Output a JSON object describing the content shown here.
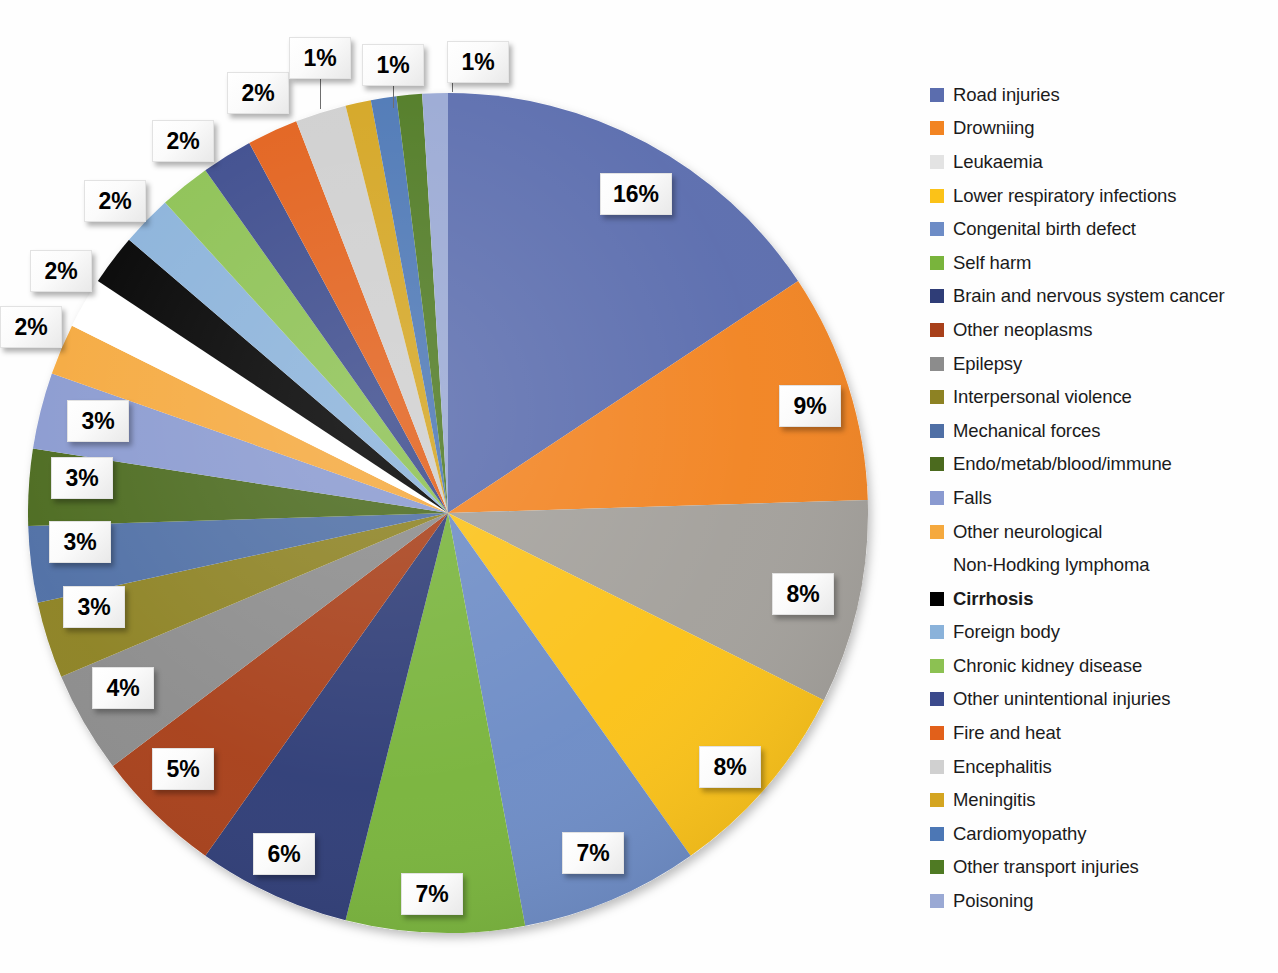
{
  "chart_data": {
    "type": "pie",
    "title": "",
    "subtitle": "",
    "xlabel": "",
    "ylabel": "",
    "grid": false,
    "legend_position": "right",
    "units": "percent",
    "start_angle_deg": 0,
    "direction": "clockwise",
    "total": 100,
    "categories": [
      "Road injuries",
      "Drowniing",
      "Leukaemia",
      "Lower respiratory infections",
      "Congenital birth defect",
      "Self harm",
      "Brain and nervous system cancer",
      "Other neoplasms",
      "Epilepsy",
      "Interpersonal violence",
      "Mechanical forces",
      "Endo/metab/blood/immune",
      "Falls",
      "Other neurological",
      "Non-Hodking lymphoma",
      "Cirrhosis",
      "Foreign body",
      "Chronic kidney disease",
      "Other unintentional injuries",
      "Fire and heat",
      "Encephalitis",
      "Meningitis",
      "Cardiomyopathy",
      "Other transport injuries",
      "Poisoning"
    ],
    "values": [
      16,
      9,
      8,
      8,
      7,
      7,
      6,
      5,
      4,
      3,
      3,
      3,
      3,
      2,
      2,
      2,
      2,
      2,
      2,
      2,
      2,
      1,
      1,
      1,
      1
    ],
    "colors": [
      "#5b6dae",
      "#f28422",
      "#a3a09b",
      "#fbc218",
      "#6d8cc6",
      "#79b43c",
      "#2f3d77",
      "#a8401a",
      "#8c8c8c",
      "#8d8223",
      "#4f6fa5",
      "#4b6a1e",
      "#8a9ad0",
      "#f5a košs",
      "#ffffff",
      "#000000",
      "#8ab2da",
      "#8cc152",
      "#3b4a8c",
      "#e2601a",
      "#cfcfcf",
      "#d4a521",
      "#4c77b5",
      "#4f7a23",
      "#9aa9d4"
    ],
    "slice_labels": [
      "16%",
      "9%",
      "8%",
      "8%",
      "7%",
      "7%",
      "6%",
      "5%",
      "4%",
      "3%",
      "3%",
      "3%",
      "3%",
      "2%",
      "2%",
      "2%",
      "2%",
      "2%",
      "2%",
      "2%",
      "2%",
      "1%",
      "1%",
      "1%",
      "1%"
    ]
  },
  "legend": {
    "items": [
      {
        "label": "Road injuries",
        "color": "#5b6dae",
        "emphasis": false
      },
      {
        "label": "Drowniing",
        "color": "#f28422",
        "emphasis": false
      },
      {
        "label": "Leukaemia",
        "color": "#e3e3e3",
        "emphasis": false
      },
      {
        "label": "Lower respiratory infections",
        "color": "#fbc218",
        "emphasis": false
      },
      {
        "label": "Congenital birth defect",
        "color": "#6d8cc6",
        "emphasis": false
      },
      {
        "label": "Self harm",
        "color": "#79b43c",
        "emphasis": false
      },
      {
        "label": "Brain and nervous system cancer",
        "color": "#2f3d77",
        "emphasis": false
      },
      {
        "label": "Other neoplasms",
        "color": "#a8401a",
        "emphasis": false
      },
      {
        "label": "Epilepsy",
        "color": "#8c8c8c",
        "emphasis": false
      },
      {
        "label": "Interpersonal violence",
        "color": "#8d8223",
        "emphasis": false
      },
      {
        "label": "Mechanical forces",
        "color": "#4f6fa5",
        "emphasis": false
      },
      {
        "label": "Endo/metab/blood/immune",
        "color": "#4b6a1e",
        "emphasis": false
      },
      {
        "label": "Falls",
        "color": "#8a9ad0",
        "emphasis": false
      },
      {
        "label": "Other neurological",
        "color": "#f5a93e",
        "emphasis": false
      },
      {
        "label": "Non-Hodking lymphoma",
        "color": "transparent",
        "emphasis": false
      },
      {
        "label": "Cirrhosis",
        "color": "#000000",
        "emphasis": true
      },
      {
        "label": "Foreign body",
        "color": "#8ab2da",
        "emphasis": false
      },
      {
        "label": "Chronic kidney disease",
        "color": "#8cc152",
        "emphasis": false
      },
      {
        "label": "Other unintentional injuries",
        "color": "#3b4a8c",
        "emphasis": false
      },
      {
        "label": "Fire and heat",
        "color": "#e2601a",
        "emphasis": false
      },
      {
        "label": "Encephalitis",
        "color": "#d0d0d0",
        "emphasis": false
      },
      {
        "label": "Meningitis",
        "color": "#d4a521",
        "emphasis": false
      },
      {
        "label": "Cardiomyopathy",
        "color": "#4c77b5",
        "emphasis": false
      },
      {
        "label": "Other transport injuries",
        "color": "#4f7a23",
        "emphasis": false
      },
      {
        "label": "Poisoning",
        "color": "#9aa9d4",
        "emphasis": false
      }
    ]
  },
  "pie_geometry": {
    "cx": 448,
    "cy": 513,
    "r": 420
  },
  "callouts": [
    {
      "text": "16%",
      "x": 600,
      "y": 173,
      "w": 72,
      "h": 42,
      "fs": 23
    },
    {
      "text": "9%",
      "x": 779,
      "y": 385,
      "w": 62,
      "h": 42,
      "fs": 23
    },
    {
      "text": "8%",
      "x": 772,
      "y": 573,
      "w": 62,
      "h": 42,
      "fs": 23
    },
    {
      "text": "8%",
      "x": 699,
      "y": 746,
      "w": 62,
      "h": 42,
      "fs": 23
    },
    {
      "text": "7%",
      "x": 562,
      "y": 832,
      "w": 62,
      "h": 42,
      "fs": 23
    },
    {
      "text": "7%",
      "x": 401,
      "y": 873,
      "w": 62,
      "h": 42,
      "fs": 23
    },
    {
      "text": "6%",
      "x": 253,
      "y": 833,
      "w": 62,
      "h": 42,
      "fs": 23
    },
    {
      "text": "5%",
      "x": 152,
      "y": 748,
      "w": 62,
      "h": 42,
      "fs": 23
    },
    {
      "text": "4%",
      "x": 92,
      "y": 667,
      "w": 62,
      "h": 42,
      "fs": 23
    },
    {
      "text": "3%",
      "x": 63,
      "y": 586,
      "w": 62,
      "h": 42,
      "fs": 23
    },
    {
      "text": "3%",
      "x": 49,
      "y": 521,
      "w": 62,
      "h": 42,
      "fs": 23
    },
    {
      "text": "3%",
      "x": 51,
      "y": 457,
      "w": 62,
      "h": 42,
      "fs": 23
    },
    {
      "text": "3%",
      "x": 67,
      "y": 400,
      "w": 62,
      "h": 42,
      "fs": 23
    },
    {
      "text": "2%",
      "x": 0,
      "y": 306,
      "w": 62,
      "h": 42,
      "fs": 23
    },
    {
      "text": "2%",
      "x": 30,
      "y": 250,
      "w": 62,
      "h": 42,
      "fs": 23
    },
    {
      "text": "2%",
      "x": 84,
      "y": 180,
      "w": 62,
      "h": 42,
      "fs": 23
    },
    {
      "text": "2%",
      "x": 152,
      "y": 120,
      "w": 62,
      "h": 42,
      "fs": 23
    },
    {
      "text": "2%",
      "x": 227,
      "y": 72,
      "w": 62,
      "h": 42,
      "fs": 23
    },
    {
      "text": "1%",
      "x": 289,
      "y": 37,
      "w": 62,
      "h": 42,
      "fs": 23
    },
    {
      "text": "1%",
      "x": 362,
      "y": 44,
      "w": 62,
      "h": 42,
      "fs": 23
    },
    {
      "text": "1%",
      "x": 447,
      "y": 41,
      "w": 62,
      "h": 42,
      "fs": 23
    }
  ],
  "leaders": [
    {
      "x": 320,
      "y": 79,
      "h": 30
    },
    {
      "x": 393,
      "y": 86,
      "h": 22
    },
    {
      "x": 452,
      "y": 62,
      "h": 30
    }
  ]
}
